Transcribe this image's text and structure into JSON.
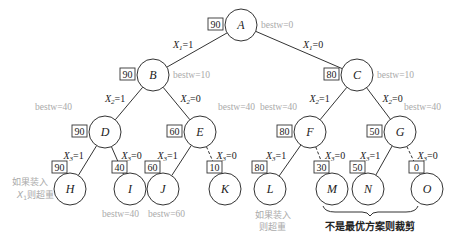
{
  "diagram": {
    "type": "branch-and-bound-tree",
    "nodes": [
      {
        "id": "A",
        "label": "A",
        "x": 241,
        "y": 25,
        "bound": "90",
        "bestw": "bestw=0"
      },
      {
        "id": "B",
        "label": "B",
        "x": 153,
        "y": 75,
        "bound": "90",
        "bestw": "bestw=10"
      },
      {
        "id": "C",
        "label": "C",
        "x": 357,
        "y": 75,
        "bound": "80",
        "bestw": "bestw=10"
      },
      {
        "id": "D",
        "label": "D",
        "x": 105,
        "y": 132,
        "bound": "90",
        "bestw": "bestw=40"
      },
      {
        "id": "E",
        "label": "E",
        "x": 200,
        "y": 132,
        "bound": "60",
        "bestw": "bestw=40"
      },
      {
        "id": "F",
        "label": "F",
        "x": 310,
        "y": 132,
        "bound": "80",
        "bestw": "bestw=40"
      },
      {
        "id": "G",
        "label": "G",
        "x": 400,
        "y": 132,
        "bound": "50",
        "bestw": "bestw=40"
      },
      {
        "id": "H",
        "label": "H",
        "x": 70,
        "y": 189,
        "bound": "90"
      },
      {
        "id": "I",
        "label": "I",
        "x": 130,
        "y": 189,
        "bound": "40",
        "bestw": "bestw=40"
      },
      {
        "id": "J",
        "label": "J",
        "x": 163,
        "y": 189,
        "bound": "60",
        "bestw": "bestw=60"
      },
      {
        "id": "K",
        "label": "K",
        "x": 225,
        "y": 189,
        "bound": "10"
      },
      {
        "id": "L",
        "label": "L",
        "x": 270,
        "y": 189,
        "bound": "80"
      },
      {
        "id": "M",
        "label": "M",
        "x": 332,
        "y": 189,
        "bound": "30"
      },
      {
        "id": "N",
        "label": "N",
        "x": 368,
        "y": 189,
        "bound": "50"
      },
      {
        "id": "O",
        "label": "O",
        "x": 427,
        "y": 189,
        "bound": "0"
      }
    ],
    "edges": [
      {
        "from": "A",
        "to": "B",
        "label": "X1=1",
        "var": "X",
        "sub": "1",
        "val": "=1",
        "dashed": false
      },
      {
        "from": "A",
        "to": "C",
        "label": "X1=0",
        "var": "X",
        "sub": "1",
        "val": "=0",
        "dashed": false
      },
      {
        "from": "B",
        "to": "D",
        "label": "X2=1",
        "var": "X",
        "sub": "2",
        "val": "=1",
        "dashed": false
      },
      {
        "from": "B",
        "to": "E",
        "label": "X2=0",
        "var": "X",
        "sub": "2",
        "val": "=0",
        "dashed": false
      },
      {
        "from": "C",
        "to": "F",
        "label": "X2=1",
        "var": "X",
        "sub": "2",
        "val": "=1",
        "dashed": false
      },
      {
        "from": "C",
        "to": "G",
        "label": "X2=0",
        "var": "X",
        "sub": "2",
        "val": "=0",
        "dashed": false
      },
      {
        "from": "D",
        "to": "H",
        "label": "X3=1",
        "var": "X",
        "sub": "3",
        "val": "=1",
        "dashed": false
      },
      {
        "from": "D",
        "to": "I",
        "label": "X3=0",
        "var": "X",
        "sub": "3",
        "val": "=0",
        "dashed": false
      },
      {
        "from": "E",
        "to": "J",
        "label": "X3=1",
        "var": "X",
        "sub": "3",
        "val": "=1",
        "dashed": false
      },
      {
        "from": "E",
        "to": "K",
        "label": "X3=0",
        "var": "X",
        "sub": "3",
        "val": "=0",
        "dashed": true
      },
      {
        "from": "F",
        "to": "L",
        "label": "X3=1",
        "var": "X",
        "sub": "3",
        "val": "=1",
        "dashed": false
      },
      {
        "from": "F",
        "to": "M",
        "label": "X3=0",
        "var": "X",
        "sub": "3",
        "val": "=0",
        "dashed": true
      },
      {
        "from": "G",
        "to": "N",
        "label": "X3=1",
        "var": "X",
        "sub": "3",
        "val": "=1",
        "dashed": false
      },
      {
        "from": "G",
        "to": "O",
        "label": "X3=0",
        "var": "X",
        "sub": "3",
        "val": "=0",
        "dashed": true
      }
    ],
    "annotations": {
      "h_note_line1": "如果装入",
      "h_note_line2_prefix": "X",
      "h_note_line2_sub": "1",
      "h_note_line2_suffix": "则超重",
      "l_note_line1": "如果装入",
      "l_note_line2": "则超重",
      "prune_note": "不是最优方案则裁剪"
    }
  }
}
